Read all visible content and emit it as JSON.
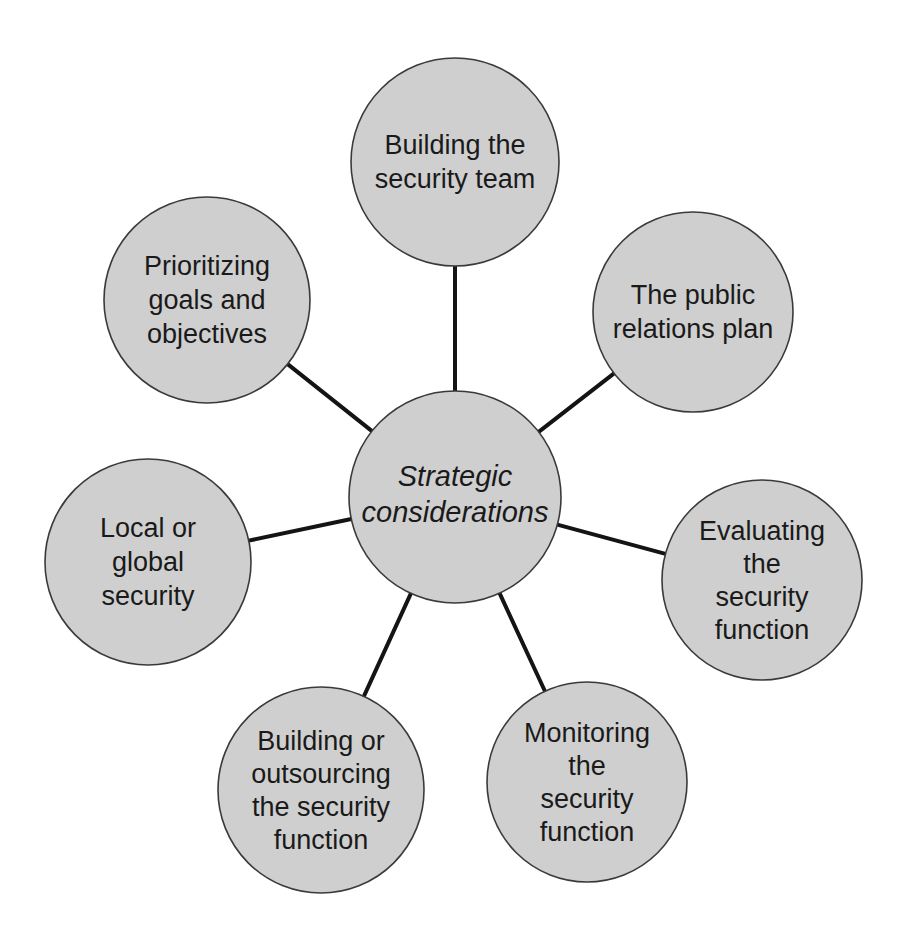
{
  "diagram": {
    "colors": {
      "background": "#ffffff",
      "node_fill": "#cfcfcf",
      "node_stroke": "#3a3a3a",
      "connector": "#141414",
      "text": "#1a1a1a"
    },
    "center": {
      "label_lines": [
        "Strategic",
        "considerations"
      ],
      "cx": 455,
      "cy": 497,
      "r": 106
    },
    "nodes": [
      {
        "id": "building-team",
        "label_lines": [
          "Building the",
          "security team"
        ],
        "cx": 455,
        "cy": 162,
        "r": 104
      },
      {
        "id": "public-relations",
        "label_lines": [
          "The public",
          "relations plan"
        ],
        "cx": 693,
        "cy": 312,
        "r": 100
      },
      {
        "id": "evaluating",
        "label_lines": [
          "Evaluating",
          "the",
          "security",
          "function"
        ],
        "cx": 762,
        "cy": 580,
        "r": 100
      },
      {
        "id": "monitoring",
        "label_lines": [
          "Monitoring",
          "the",
          "security",
          "function"
        ],
        "cx": 587,
        "cy": 782,
        "r": 100
      },
      {
        "id": "building-outsourcing",
        "label_lines": [
          "Building or",
          "outsourcing",
          "the security",
          "function"
        ],
        "cx": 321,
        "cy": 790,
        "r": 103
      },
      {
        "id": "local-global",
        "label_lines": [
          "Local or",
          "global",
          "security"
        ],
        "cx": 148,
        "cy": 562,
        "r": 103
      },
      {
        "id": "prioritizing",
        "label_lines": [
          "Prioritizing",
          "goals and",
          "objectives"
        ],
        "cx": 207,
        "cy": 300,
        "r": 103
      }
    ]
  }
}
